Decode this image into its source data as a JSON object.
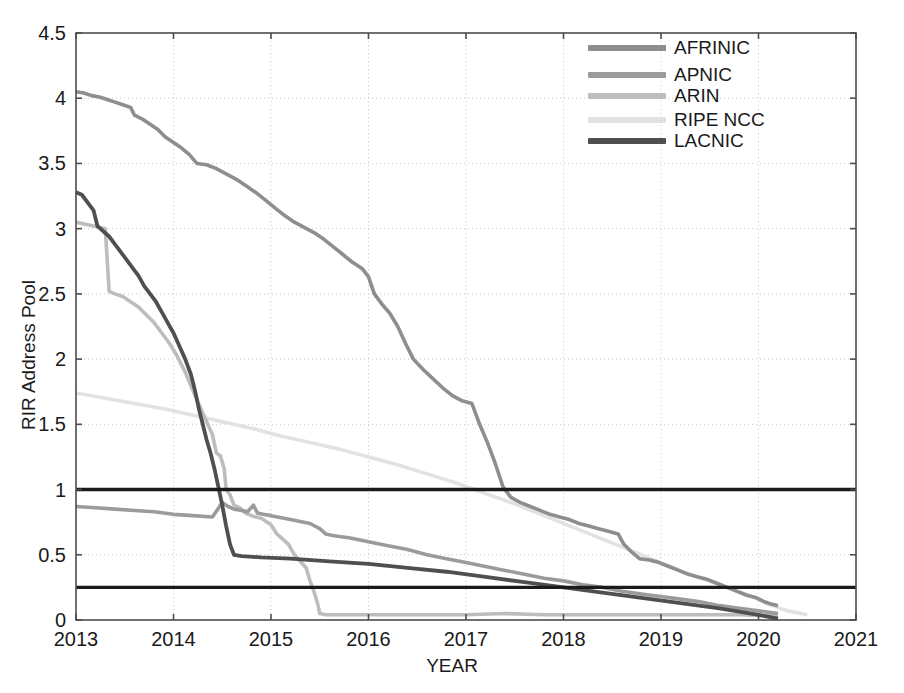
{
  "figure": {
    "background": "#ffffff",
    "plot_left": 76,
    "plot_top": 33,
    "plot_right": 856,
    "plot_bottom": 620
  },
  "chart_data": {
    "type": "line",
    "title": "",
    "xlabel": "YEAR",
    "ylabel": "RIR Address Pool",
    "xlim": [
      2013,
      2021
    ],
    "ylim": [
      0,
      4.5
    ],
    "xticks": [
      2013,
      2014,
      2015,
      2016,
      2017,
      2018,
      2019,
      2020,
      2021
    ],
    "xtick_labels": [
      "2013",
      "2014",
      "2015",
      "2016",
      "2017",
      "2018",
      "2019",
      "2020",
      "2021"
    ],
    "yticks": [
      0,
      0.5,
      1,
      1.5,
      2,
      2.5,
      3,
      3.5,
      4,
      4.5
    ],
    "ytick_labels": [
      "0",
      "0.5",
      "1",
      "1.5",
      "2",
      "2.5",
      "3",
      "3.5",
      "4",
      "4.5"
    ],
    "grid": true,
    "grid_style": "dotted",
    "grid_color": "#c8c8c8",
    "axis_color": "#4d4d4d",
    "legend_position": "top-center-right",
    "reference_lines": [
      {
        "name": "threshold-1",
        "y": 1.0,
        "color": "#1a1a1a",
        "width": 3.4
      },
      {
        "name": "threshold-0.25",
        "y": 0.25,
        "color": "#1a1a1a",
        "width": 3.4
      }
    ],
    "series": [
      {
        "name": "AFRINIC",
        "color": "#8e8e8e",
        "width": 3.6,
        "points": [
          [
            2013.0,
            4.05
          ],
          [
            2013.08,
            4.04
          ],
          [
            2013.16,
            4.02
          ],
          [
            2013.24,
            4.01
          ],
          [
            2013.32,
            3.99
          ],
          [
            2013.4,
            3.97
          ],
          [
            2013.48,
            3.95
          ],
          [
            2013.56,
            3.93
          ],
          [
            2013.6,
            3.87
          ],
          [
            2013.68,
            3.84
          ],
          [
            2013.76,
            3.8
          ],
          [
            2013.84,
            3.76
          ],
          [
            2013.92,
            3.7
          ],
          [
            2014.0,
            3.66
          ],
          [
            2014.08,
            3.62
          ],
          [
            2014.16,
            3.57
          ],
          [
            2014.24,
            3.5
          ],
          [
            2014.34,
            3.49
          ],
          [
            2014.44,
            3.46
          ],
          [
            2014.54,
            3.42
          ],
          [
            2014.64,
            3.38
          ],
          [
            2014.74,
            3.33
          ],
          [
            2014.84,
            3.28
          ],
          [
            2014.94,
            3.22
          ],
          [
            2015.04,
            3.16
          ],
          [
            2015.14,
            3.1
          ],
          [
            2015.24,
            3.05
          ],
          [
            2015.34,
            3.01
          ],
          [
            2015.44,
            2.97
          ],
          [
            2015.54,
            2.92
          ],
          [
            2015.64,
            2.86
          ],
          [
            2015.74,
            2.8
          ],
          [
            2015.84,
            2.74
          ],
          [
            2015.94,
            2.69
          ],
          [
            2016.0,
            2.63
          ],
          [
            2016.06,
            2.5
          ],
          [
            2016.14,
            2.42
          ],
          [
            2016.22,
            2.35
          ],
          [
            2016.3,
            2.25
          ],
          [
            2016.38,
            2.12
          ],
          [
            2016.46,
            2.0
          ],
          [
            2016.56,
            1.92
          ],
          [
            2016.66,
            1.85
          ],
          [
            2016.76,
            1.78
          ],
          [
            2016.86,
            1.72
          ],
          [
            2016.96,
            1.68
          ],
          [
            2017.06,
            1.66
          ],
          [
            2017.14,
            1.5
          ],
          [
            2017.22,
            1.36
          ],
          [
            2017.3,
            1.2
          ],
          [
            2017.38,
            1.02
          ],
          [
            2017.46,
            0.94
          ],
          [
            2017.56,
            0.9
          ],
          [
            2017.66,
            0.87
          ],
          [
            2017.76,
            0.84
          ],
          [
            2017.86,
            0.81
          ],
          [
            2017.96,
            0.79
          ],
          [
            2018.06,
            0.77
          ],
          [
            2018.16,
            0.74
          ],
          [
            2018.26,
            0.72
          ],
          [
            2018.36,
            0.7
          ],
          [
            2018.46,
            0.68
          ],
          [
            2018.56,
            0.66
          ],
          [
            2018.62,
            0.58
          ],
          [
            2018.7,
            0.52
          ],
          [
            2018.78,
            0.47
          ],
          [
            2018.88,
            0.46
          ],
          [
            2018.98,
            0.44
          ],
          [
            2019.08,
            0.41
          ],
          [
            2019.18,
            0.38
          ],
          [
            2019.28,
            0.35
          ],
          [
            2019.38,
            0.33
          ],
          [
            2019.48,
            0.31
          ],
          [
            2019.58,
            0.28
          ],
          [
            2019.68,
            0.25
          ],
          [
            2019.78,
            0.22
          ],
          [
            2019.88,
            0.19
          ],
          [
            2019.98,
            0.17
          ],
          [
            2020.06,
            0.14
          ],
          [
            2020.14,
            0.12
          ],
          [
            2020.2,
            0.11
          ]
        ]
      },
      {
        "name": "APNIC",
        "color": "#9b9b9b",
        "width": 3.6,
        "points": [
          [
            2013.0,
            0.87
          ],
          [
            2013.2,
            0.86
          ],
          [
            2013.4,
            0.85
          ],
          [
            2013.6,
            0.84
          ],
          [
            2013.8,
            0.83
          ],
          [
            2014.0,
            0.81
          ],
          [
            2014.2,
            0.8
          ],
          [
            2014.4,
            0.79
          ],
          [
            2014.5,
            0.9
          ],
          [
            2014.56,
            0.87
          ],
          [
            2014.62,
            0.85
          ],
          [
            2014.7,
            0.84
          ],
          [
            2014.76,
            0.83
          ],
          [
            2014.82,
            0.88
          ],
          [
            2014.86,
            0.82
          ],
          [
            2014.92,
            0.81
          ],
          [
            2015.0,
            0.8
          ],
          [
            2015.2,
            0.77
          ],
          [
            2015.4,
            0.74
          ],
          [
            2015.5,
            0.7
          ],
          [
            2015.56,
            0.66
          ],
          [
            2015.62,
            0.65
          ],
          [
            2015.7,
            0.64
          ],
          [
            2015.8,
            0.63
          ],
          [
            2016.0,
            0.6
          ],
          [
            2016.2,
            0.57
          ],
          [
            2016.4,
            0.54
          ],
          [
            2016.6,
            0.5
          ],
          [
            2016.8,
            0.47
          ],
          [
            2017.0,
            0.44
          ],
          [
            2017.2,
            0.41
          ],
          [
            2017.4,
            0.38
          ],
          [
            2017.6,
            0.35
          ],
          [
            2017.8,
            0.32
          ],
          [
            2018.0,
            0.3
          ],
          [
            2018.2,
            0.27
          ],
          [
            2018.4,
            0.25
          ],
          [
            2018.6,
            0.22
          ],
          [
            2018.8,
            0.2
          ],
          [
            2019.0,
            0.18
          ],
          [
            2019.2,
            0.16
          ],
          [
            2019.4,
            0.14
          ],
          [
            2019.6,
            0.11
          ],
          [
            2019.8,
            0.09
          ],
          [
            2020.0,
            0.07
          ],
          [
            2020.2,
            0.05
          ]
        ]
      },
      {
        "name": "ARIN",
        "color": "#bdbdbd",
        "width": 3.6,
        "points": [
          [
            2013.0,
            3.05
          ],
          [
            2013.06,
            3.04
          ],
          [
            2013.12,
            3.03
          ],
          [
            2013.18,
            3.02
          ],
          [
            2013.24,
            3.01
          ],
          [
            2013.3,
            3.0
          ],
          [
            2013.34,
            2.52
          ],
          [
            2013.4,
            2.5
          ],
          [
            2013.48,
            2.48
          ],
          [
            2013.56,
            2.44
          ],
          [
            2013.64,
            2.4
          ],
          [
            2013.72,
            2.34
          ],
          [
            2013.8,
            2.28
          ],
          [
            2013.88,
            2.2
          ],
          [
            2013.96,
            2.12
          ],
          [
            2014.04,
            2.02
          ],
          [
            2014.12,
            1.9
          ],
          [
            2014.2,
            1.76
          ],
          [
            2014.28,
            1.62
          ],
          [
            2014.34,
            1.52
          ],
          [
            2014.4,
            1.42
          ],
          [
            2014.44,
            1.28
          ],
          [
            2014.48,
            1.26
          ],
          [
            2014.52,
            1.16
          ],
          [
            2014.54,
            1.0
          ],
          [
            2014.58,
            0.96
          ],
          [
            2014.62,
            0.88
          ],
          [
            2014.68,
            0.86
          ],
          [
            2014.74,
            0.82
          ],
          [
            2014.8,
            0.8
          ],
          [
            2014.9,
            0.78
          ],
          [
            2015.0,
            0.73
          ],
          [
            2015.06,
            0.66
          ],
          [
            2015.12,
            0.62
          ],
          [
            2015.18,
            0.58
          ],
          [
            2015.24,
            0.5
          ],
          [
            2015.3,
            0.45
          ],
          [
            2015.36,
            0.4
          ],
          [
            2015.4,
            0.3
          ],
          [
            2015.44,
            0.22
          ],
          [
            2015.48,
            0.12
          ],
          [
            2015.5,
            0.05
          ],
          [
            2015.56,
            0.04
          ],
          [
            2015.8,
            0.04
          ],
          [
            2016.2,
            0.04
          ],
          [
            2016.6,
            0.04
          ],
          [
            2017.0,
            0.04
          ],
          [
            2017.4,
            0.05
          ],
          [
            2017.8,
            0.04
          ],
          [
            2018.2,
            0.04
          ],
          [
            2018.6,
            0.04
          ],
          [
            2019.0,
            0.04
          ],
          [
            2019.4,
            0.04
          ],
          [
            2019.8,
            0.04
          ],
          [
            2020.2,
            0.03
          ]
        ]
      },
      {
        "name": "RIPE NCC",
        "color": "#e2e2e2",
        "width": 3.6,
        "points": [
          [
            2013.0,
            1.74
          ],
          [
            2013.3,
            1.7
          ],
          [
            2013.6,
            1.66
          ],
          [
            2013.9,
            1.62
          ],
          [
            2014.2,
            1.57
          ],
          [
            2014.5,
            1.52
          ],
          [
            2014.8,
            1.47
          ],
          [
            2015.1,
            1.41
          ],
          [
            2015.4,
            1.36
          ],
          [
            2015.7,
            1.31
          ],
          [
            2016.0,
            1.25
          ],
          [
            2016.3,
            1.19
          ],
          [
            2016.6,
            1.12
          ],
          [
            2016.9,
            1.05
          ],
          [
            2017.2,
            0.97
          ],
          [
            2017.5,
            0.89
          ],
          [
            2017.8,
            0.8
          ],
          [
            2018.1,
            0.71
          ],
          [
            2018.4,
            0.62
          ],
          [
            2018.7,
            0.53
          ],
          [
            2019.0,
            0.44
          ],
          [
            2019.3,
            0.35
          ],
          [
            2019.6,
            0.27
          ],
          [
            2019.9,
            0.19
          ],
          [
            2020.1,
            0.12
          ],
          [
            2020.3,
            0.07
          ],
          [
            2020.5,
            0.04
          ]
        ]
      },
      {
        "name": "LACNIC",
        "color": "#4f4f4f",
        "width": 3.8,
        "points": [
          [
            2013.0,
            3.28
          ],
          [
            2013.06,
            3.26
          ],
          [
            2013.12,
            3.2
          ],
          [
            2013.18,
            3.14
          ],
          [
            2013.22,
            3.02
          ],
          [
            2013.28,
            2.98
          ],
          [
            2013.34,
            2.94
          ],
          [
            2013.4,
            2.88
          ],
          [
            2013.46,
            2.82
          ],
          [
            2013.52,
            2.76
          ],
          [
            2013.58,
            2.7
          ],
          [
            2013.64,
            2.64
          ],
          [
            2013.7,
            2.56
          ],
          [
            2013.76,
            2.5
          ],
          [
            2013.82,
            2.44
          ],
          [
            2013.88,
            2.36
          ],
          [
            2013.94,
            2.28
          ],
          [
            2014.0,
            2.2
          ],
          [
            2014.06,
            2.1
          ],
          [
            2014.12,
            2.0
          ],
          [
            2014.18,
            1.88
          ],
          [
            2014.22,
            1.76
          ],
          [
            2014.26,
            1.62
          ],
          [
            2014.3,
            1.5
          ],
          [
            2014.34,
            1.38
          ],
          [
            2014.38,
            1.28
          ],
          [
            2014.42,
            1.16
          ],
          [
            2014.46,
            1.02
          ],
          [
            2014.5,
            0.88
          ],
          [
            2014.54,
            0.72
          ],
          [
            2014.58,
            0.58
          ],
          [
            2014.62,
            0.5
          ],
          [
            2014.7,
            0.49
          ],
          [
            2014.9,
            0.48
          ],
          [
            2015.2,
            0.47
          ],
          [
            2015.6,
            0.45
          ],
          [
            2016.0,
            0.43
          ],
          [
            2016.4,
            0.4
          ],
          [
            2016.8,
            0.37
          ],
          [
            2017.2,
            0.33
          ],
          [
            2017.6,
            0.29
          ],
          [
            2018.0,
            0.25
          ],
          [
            2018.4,
            0.21
          ],
          [
            2018.8,
            0.17
          ],
          [
            2019.2,
            0.13
          ],
          [
            2019.6,
            0.09
          ],
          [
            2020.0,
            0.04
          ],
          [
            2020.2,
            0.01
          ]
        ]
      }
    ]
  },
  "legend": {
    "entries": [
      {
        "label": "AFRINIC",
        "color": "#8e8e8e"
      },
      {
        "label": "APNIC",
        "color": "#9b9b9b"
      },
      {
        "label": "ARIN",
        "color": "#bdbdbd"
      },
      {
        "label": "RIPE NCC",
        "color": "#e2e2e2"
      },
      {
        "label": "LACNIC",
        "color": "#4f4f4f"
      }
    ]
  }
}
